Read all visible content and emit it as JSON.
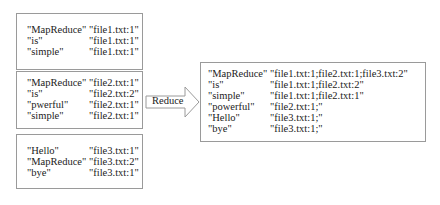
{
  "map_outputs": [
    {
      "rows": [
        {
          "key": "\"MapReduce\"",
          "value": "\"file1.txt:1\""
        },
        {
          "key": "\"is\"",
          "value": "\"file1.txt:1\""
        },
        {
          "key": "\"simple\"",
          "value": "\"file1.txt:1\""
        }
      ]
    },
    {
      "rows": [
        {
          "key": "\"MapReduce\"",
          "value": "\"file2.txt:1\""
        },
        {
          "key": "\"is\"",
          "value": "\"file2.txt:2\""
        },
        {
          "key": "\"pwerful\"",
          "value": "\"file2.txt:1\""
        },
        {
          "key": "\"simple\"",
          "value": "\"file2.txt:1\""
        }
      ]
    },
    {
      "rows": [
        {
          "key": "\"Hello\"",
          "value": "\"file3.txt:1\""
        },
        {
          "key": "\"MapReduce\"",
          "value": "\"file3.txt:2\""
        },
        {
          "key": "\"bye\"",
          "value": "\"file3.txt:1\""
        }
      ]
    }
  ],
  "arrow": {
    "label": "Reduce"
  },
  "reduce_output": {
    "rows": [
      {
        "key": "\"MapReduce\"",
        "value": "\"file1.txt:1;file2.txt:1;file3.txt:2\""
      },
      {
        "key": "\"is\"",
        "value": "\"file1.txt:1;file2.txt:2\""
      },
      {
        "key": "\"simple\"",
        "value": "\"file1.txt:1;file2.txt:1\""
      },
      {
        "key": "\"powerful\"",
        "value": "\"file2.txt:1;\""
      },
      {
        "key": "\"Hello\"",
        "value": "\"file3.txt:1;\""
      },
      {
        "key": "\"bye\"",
        "value": "\"file3.txt:1;\""
      }
    ]
  }
}
